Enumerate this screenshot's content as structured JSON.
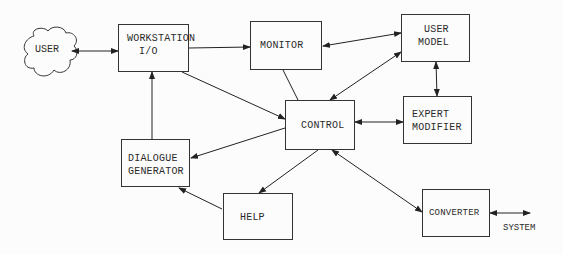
{
  "diagram": {
    "type": "block-diagram",
    "nodes": {
      "user": {
        "label": "USER",
        "shape": "cloud"
      },
      "workstation": {
        "line1": "WORKSTATION",
        "line2": "I/O"
      },
      "monitor": {
        "label": "MONITOR"
      },
      "user_model": {
        "line1": "USER",
        "line2": "MODEL"
      },
      "control": {
        "label": "CONTROL"
      },
      "expert_modifier": {
        "line1": "EXPERT",
        "line2": "MODIFIER"
      },
      "dialogue_generator": {
        "line1": "DIALOGUE",
        "line2": "GENERATOR"
      },
      "help": {
        "label": "HELP"
      },
      "converter": {
        "label": "CONVERTER"
      },
      "system": {
        "label": "SYSTEM"
      }
    },
    "edges": [
      {
        "from": "USER",
        "to": "WORKSTATION I/O",
        "direction": "both"
      },
      {
        "from": "WORKSTATION I/O",
        "to": "MONITOR",
        "direction": "forward"
      },
      {
        "from": "MONITOR",
        "to": "USER MODEL",
        "direction": "both"
      },
      {
        "from": "MONITOR",
        "to": "CONTROL",
        "direction": "none"
      },
      {
        "from": "CONTROL",
        "to": "USER MODEL",
        "direction": "both"
      },
      {
        "from": "USER MODEL",
        "to": "EXPERT MODIFIER",
        "direction": "both"
      },
      {
        "from": "CONTROL",
        "to": "EXPERT MODIFIER",
        "direction": "both"
      },
      {
        "from": "WORKSTATION I/O",
        "to": "CONTROL",
        "direction": "forward"
      },
      {
        "from": "CONTROL",
        "to": "DIALOGUE GENERATOR",
        "direction": "forward"
      },
      {
        "from": "DIALOGUE GENERATOR",
        "to": "WORKSTATION I/O",
        "direction": "forward"
      },
      {
        "from": "CONTROL",
        "to": "HELP",
        "direction": "forward"
      },
      {
        "from": "HELP",
        "to": "DIALOGUE GENERATOR",
        "direction": "forward"
      },
      {
        "from": "CONTROL",
        "to": "CONVERTER",
        "direction": "both"
      },
      {
        "from": "CONVERTER",
        "to": "SYSTEM",
        "direction": "both"
      }
    ],
    "colors": {
      "ink": "#2a2a2a",
      "paper": "#fcfcfc"
    }
  }
}
